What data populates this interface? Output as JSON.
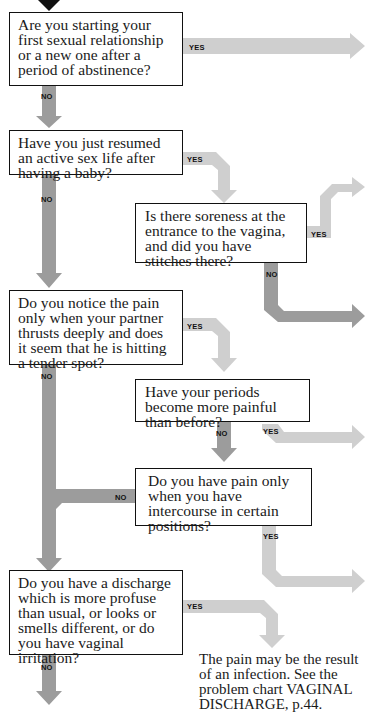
{
  "flowchart": {
    "questions": [
      {
        "id": "q1",
        "text": "Are you starting your first sexual relationship or a new one after a period of abstinence?"
      },
      {
        "id": "q2",
        "text": "Have you just resumed an active sex life after having a baby?"
      },
      {
        "id": "q3",
        "text": "Is there soreness at the entrance to the vagina, and did you have stitches there?"
      },
      {
        "id": "q4",
        "text": "Do you notice the pain only when your partner thrusts deeply and does it seem that he is hitting a tender spot?"
      },
      {
        "id": "q5",
        "text": "Have your periods become more painful than before?"
      },
      {
        "id": "q6",
        "text": "Do you have pain only when you have intercourse in certain positions?"
      },
      {
        "id": "q7",
        "text": "Do you have a discharge which is more profuse than usual, or looks or smells different, or do you have vaginal irritation?"
      }
    ],
    "labels": {
      "yes": "YES",
      "no": "NO"
    },
    "conclusion": "The pain may be the result of an infection. See the problem chart VAGINAL DISCHARGE, p.44.",
    "colors": {
      "yes_arrow": "#cfcfcf",
      "no_arrow": "#9c9c9c",
      "entry_arrow": "#111111",
      "box_border": "#111111"
    }
  }
}
